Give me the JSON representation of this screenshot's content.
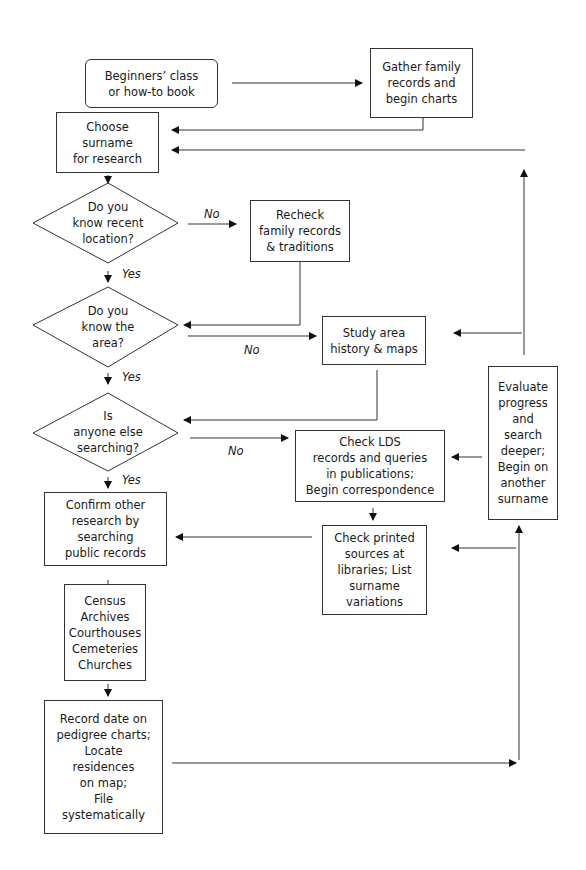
{
  "nodes": {
    "beginners": "Beginners’ class\nor how-to book",
    "gather": "Gather family\nrecords and\nbegin charts",
    "choose": "Choose\nsurname\nfor research",
    "q_location": "Do you\nknow recent\nlocation?",
    "recheck": "Recheck\nfamily records\n& traditions",
    "q_area": "Do you\nknow the\narea?",
    "study": "Study area\nhistory & maps",
    "q_anyone": "Is\nanyone else\nsearching?",
    "check_lds": "Check LDS\nrecords and queries\nin publications;\nBegin correspondence",
    "evaluate": "Evaluate\nprogress\nand\nsearch\ndeeper;\nBegin on\nanother\nsurname",
    "confirm": "Confirm other\nresearch by\nsearching\npublic records",
    "printed": "Check printed\nsources at\nlibraries; List\nsurname\nvariations",
    "sources_list": "Census\nArchives\nCourthouses\nCemeteries\nChurches",
    "record": "Record date on\npedigree charts;\nLocate\nresidences\non map;\nFile\nsystematically"
  },
  "labels": {
    "no1": "No",
    "yes1": "Yes",
    "no2": "No",
    "yes2": "Yes",
    "no3": "No",
    "yes3": "Yes"
  }
}
